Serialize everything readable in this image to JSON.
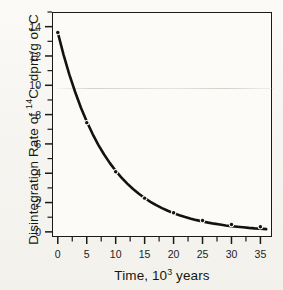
{
  "figure": {
    "background_color": "#f7f6f2",
    "ink_color": "#1a1a18",
    "plot_background_color": "#fcfbf8"
  },
  "axes": {
    "x": {
      "title_prefix": "Time, 10",
      "title_superscript": "3",
      "title_suffix": " years",
      "title_full": "Time, 10³ years",
      "ticks": [
        0,
        5,
        10,
        15,
        20,
        25,
        30,
        35
      ],
      "tick_labels": [
        "0",
        "5",
        "10",
        "15",
        "20",
        "25",
        "30",
        "35"
      ],
      "minor_tick_step": 2.5,
      "range": [
        -1.0,
        37.0
      ]
    },
    "y": {
      "title_prefix": "Disintegration Rate of ",
      "title_superscript": "14",
      "title_suffix": "C, dpm/g of C",
      "title_full": "Disintegration Rate of ¹⁴C, dpm/g of C",
      "ticks": [
        0,
        2,
        4,
        6,
        8,
        10,
        12,
        14
      ],
      "tick_labels": [
        "0",
        "2",
        "4",
        "6",
        "8",
        "10",
        "12",
        "14"
      ],
      "minor_ticks": [
        1,
        3,
        5,
        7,
        9,
        11,
        13,
        15
      ],
      "range": [
        -0.35,
        15.0
      ]
    }
  },
  "chart_data": {
    "type": "line",
    "title": "",
    "subtitle": "",
    "xlabel": "Time, 10³ years",
    "ylabel": "Disintegration Rate of ¹⁴C, dpm/g of C",
    "xlim": [
      -1.0,
      37.0
    ],
    "ylim": [
      -0.35,
      15.0
    ],
    "grid": false,
    "legend": false,
    "legend_position": "none",
    "marker_style": "filled-circle",
    "line_style": "solid-thick",
    "series": [
      {
        "name": "Carbon-14 disintegration rate",
        "x": [
          0,
          5,
          10,
          15,
          20,
          25,
          30,
          35
        ],
        "y": [
          13.6,
          7.45,
          4.1,
          2.3,
          1.3,
          0.78,
          0.5,
          0.35
        ],
        "color": "#111111"
      }
    ],
    "curve": {
      "model": "exponential-decay",
      "initial_value": 13.6,
      "half_life_kyr": 5.73,
      "points_x": [
        0,
        1,
        2,
        3,
        4,
        5,
        6,
        7,
        8,
        9,
        10,
        11,
        12,
        13,
        14,
        15,
        16,
        17,
        18,
        19,
        20,
        21,
        22,
        23,
        24,
        25,
        26,
        27,
        28,
        29,
        30,
        31,
        32,
        33,
        34,
        35,
        36
      ],
      "points_y": [
        13.6,
        12.08,
        10.73,
        9.54,
        8.47,
        7.53,
        6.69,
        5.94,
        5.28,
        4.69,
        4.17,
        3.7,
        3.29,
        2.92,
        2.6,
        2.31,
        2.05,
        1.82,
        1.62,
        1.44,
        1.28,
        1.13,
        1.01,
        0.9,
        0.8,
        0.71,
        0.63,
        0.56,
        0.5,
        0.44,
        0.39,
        0.35,
        0.31,
        0.27,
        0.24,
        0.22,
        0.19
      ]
    }
  }
}
